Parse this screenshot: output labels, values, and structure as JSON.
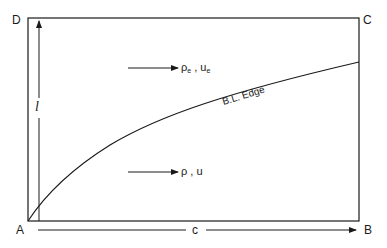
{
  "diagram": {
    "corners": {
      "top_left": "D",
      "top_right": "C",
      "bottom_left": "A",
      "bottom_right": "B"
    },
    "dimensions": {
      "height_label": "l",
      "width_label": "c"
    },
    "curve_label": "B.L. Edge",
    "outer_flow": {
      "density": "ρ",
      "density_sub": "e",
      "separator": " , ",
      "velocity": "u",
      "velocity_sub": "e"
    },
    "inner_flow": {
      "density": "ρ",
      "separator": " , ",
      "velocity": "u"
    },
    "colors": {
      "line": "#1a1a1a",
      "background": "#ffffff"
    }
  }
}
